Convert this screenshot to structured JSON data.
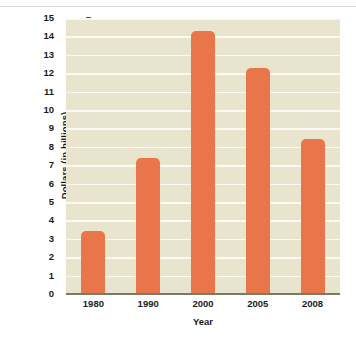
{
  "chart_data": {
    "type": "bar",
    "title": "",
    "subtitle": "",
    "xlabel": "Year",
    "ylabel": "Dollars (in billions)",
    "categories": [
      "1980",
      "1990",
      "2000",
      "2005",
      "2008"
    ],
    "values": [
      3.4,
      7.4,
      14.3,
      12.3,
      8.4
    ],
    "ylim": [
      0,
      15
    ],
    "ytick_labels": [
      "0",
      "1",
      "2",
      "3",
      "4",
      "5",
      "6",
      "7",
      "8",
      "9",
      "10",
      "11",
      "12",
      "13",
      "14",
      "15"
    ],
    "ytick_values": [
      0,
      1,
      2,
      3,
      4,
      5,
      6,
      7,
      8,
      9,
      10,
      11,
      12,
      13,
      14,
      15
    ],
    "grid": true,
    "legend": null,
    "legend_position": "none",
    "colors": {
      "bar": "#e8764a",
      "plot_background": "#e9e4cd",
      "gridline": "#fbfaf2",
      "axis": "#7a7a6a",
      "text": "#1a1a1a",
      "page_background": "#ffffff",
      "top_rule": "#d9d9d9"
    }
  }
}
